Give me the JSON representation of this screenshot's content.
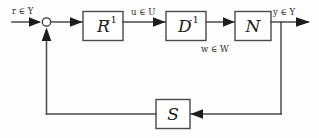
{
  "diagram": {
    "type": "control-system-block-diagram",
    "colors": {
      "background": "#fdfdfd",
      "line": "#4a4a4a",
      "arrow": "#1c1c1c",
      "text": "#1a1a1a",
      "box_fill": "#ffffff"
    },
    "blocks": [
      {
        "id": "r-inverse",
        "base": "R",
        "exponent": "-1",
        "label": "R⁻¹"
      },
      {
        "id": "d-inverse",
        "base": "D",
        "exponent": "-1",
        "label": "D⁻¹"
      },
      {
        "id": "n",
        "base": "N",
        "exponent": "",
        "label": "N"
      },
      {
        "id": "s",
        "base": "S",
        "exponent": "",
        "label": "S"
      }
    ],
    "signals": [
      {
        "id": "input",
        "var": "r",
        "member": "∈",
        "set": "Y",
        "text": "r ∈ Y"
      },
      {
        "id": "u",
        "var": "u",
        "member": "∈",
        "set": "U",
        "text": "u ∈ U"
      },
      {
        "id": "w",
        "var": "w",
        "member": "∈",
        "set": "W",
        "text": "w ∈ W"
      },
      {
        "id": "output",
        "var": "y",
        "member": "∈",
        "set": "Y",
        "text": "y ∈ Y"
      }
    ],
    "summing_junction": {
      "id": "sum",
      "symbol": ""
    }
  }
}
